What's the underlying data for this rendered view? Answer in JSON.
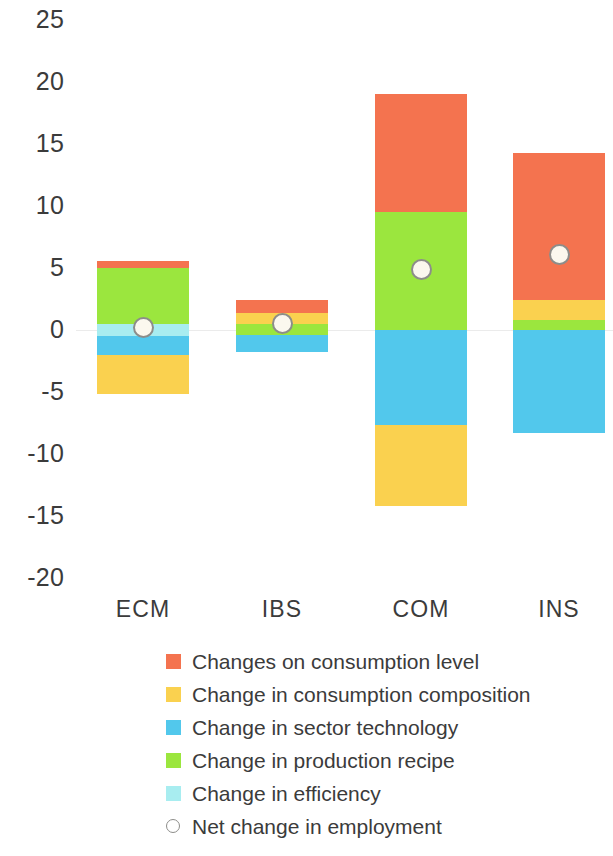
{
  "chart_data": {
    "type": "bar",
    "subtype": "stacked-bar-with-net-marker",
    "title": "",
    "subtitle": "",
    "xlabel": "",
    "ylabel": "",
    "categories": [
      "ECM",
      "IBS",
      "COM",
      "INS"
    ],
    "ylim": [
      -20,
      25
    ],
    "yticks": [
      25,
      20,
      15,
      10,
      5,
      0,
      -5,
      -10,
      -15,
      -20
    ],
    "ytick_labels": [
      "25",
      "20",
      "15",
      "10",
      "5",
      "0",
      "-5",
      "-10",
      "-15",
      "-20"
    ],
    "grid": false,
    "zero_line": true,
    "legend_position": "bottom",
    "series": [
      {
        "name": "Changes on consumption level",
        "color": "#F4734F",
        "values": [
          0.6,
          1.0,
          9.5,
          11.9
        ]
      },
      {
        "name": "Change in consumption composition",
        "color": "#FAD14F",
        "values": [
          -3.2,
          0.9,
          -6.5,
          1.6
        ]
      },
      {
        "name": "Change in sector technology",
        "color": "#52C8EC",
        "values": [
          -1.5,
          -1.4,
          -7.7,
          -8.3
        ]
      },
      {
        "name": "Change in production recipe",
        "color": "#9BE63E",
        "values": [
          4.5,
          0.9,
          9.5,
          0.8
        ]
      },
      {
        "name": "Change in efficiency",
        "color": "#A8EDF0",
        "values": [
          1.0,
          0.0,
          0.0,
          0.0
        ]
      }
    ],
    "stack_order_positive": [
      "Change in efficiency",
      "Change in production recipe",
      "Change in consumption composition",
      "Changes on consumption level"
    ],
    "net_change": {
      "name": "Net change in employment",
      "marker": "open-circle",
      "marker_face_color": "#FBF8EE",
      "marker_edge_color": "#8D8D8A",
      "values": [
        0.2,
        0.5,
        4.9,
        6.1
      ]
    },
    "bars": [
      {
        "category": "ECM",
        "segments": [
          {
            "series": "Changes on consumption level",
            "from": 5.0,
            "to": 5.6,
            "color": "#F4734F"
          },
          {
            "series": "Change in production recipe",
            "from": 0.5,
            "to": 5.0,
            "color": "#9BE63E"
          },
          {
            "series": "Change in efficiency",
            "from": -0.5,
            "to": 0.5,
            "color": "#A8EDF0"
          },
          {
            "series": "Change in sector technology",
            "from": -2.0,
            "to": -0.5,
            "color": "#52C8EC"
          },
          {
            "series": "Change in consumption composition",
            "from": -5.2,
            "to": -2.0,
            "color": "#FAD14F"
          }
        ],
        "net": 0.2
      },
      {
        "category": "IBS",
        "segments": [
          {
            "series": "Changes on consumption level",
            "from": 1.4,
            "to": 2.4,
            "color": "#F4734F"
          },
          {
            "series": "Change in consumption composition",
            "from": 0.5,
            "to": 1.4,
            "color": "#FAD14F"
          },
          {
            "series": "Change in production recipe",
            "from": -0.4,
            "to": 0.5,
            "color": "#9BE63E"
          },
          {
            "series": "Change in sector technology",
            "from": -1.8,
            "to": -0.4,
            "color": "#52C8EC"
          }
        ],
        "net": 0.5
      },
      {
        "category": "COM",
        "segments": [
          {
            "series": "Changes on consumption level",
            "from": 9.5,
            "to": 19.0,
            "color": "#F4734F"
          },
          {
            "series": "Change in production recipe",
            "from": 0.0,
            "to": 9.5,
            "color": "#9BE63E"
          },
          {
            "series": "Change in sector technology",
            "from": -7.7,
            "to": 0.0,
            "color": "#52C8EC"
          },
          {
            "series": "Change in consumption composition",
            "from": -14.2,
            "to": -7.7,
            "color": "#FAD14F"
          }
        ],
        "net": 4.9
      },
      {
        "category": "INS",
        "segments": [
          {
            "series": "Changes on consumption level",
            "from": 2.4,
            "to": 14.3,
            "color": "#F4734F"
          },
          {
            "series": "Change in consumption composition",
            "from": 0.8,
            "to": 2.4,
            "color": "#FAD14F"
          },
          {
            "series": "Change in production recipe",
            "from": 0.0,
            "to": 0.8,
            "color": "#9BE63E"
          },
          {
            "series": "Change in sector technology",
            "from": -8.3,
            "to": 0.0,
            "color": "#52C8EC"
          }
        ],
        "net": 6.1
      }
    ]
  },
  "axis": {
    "ytick_labels": [
      "25",
      "20",
      "15",
      "10",
      "5",
      "0",
      "-5",
      "-10",
      "-15",
      "-20"
    ],
    "category_labels": [
      "ECM",
      "IBS",
      "COM",
      "INS"
    ]
  },
  "legend": {
    "items": [
      {
        "label": "Changes on consumption level",
        "color": "#F4734F",
        "marker": "square"
      },
      {
        "label": "Change in consumption composition",
        "color": "#FAD14F",
        "marker": "square"
      },
      {
        "label": "Change in sector technology",
        "color": "#52C8EC",
        "marker": "square"
      },
      {
        "label": "Change in production recipe",
        "color": "#9BE63E",
        "marker": "square"
      },
      {
        "label": "Change in efficiency",
        "color": "#A8EDF0",
        "marker": "square"
      },
      {
        "label": "Net change in employment",
        "color": "#FFFFFF",
        "marker": "open-circle"
      }
    ]
  }
}
